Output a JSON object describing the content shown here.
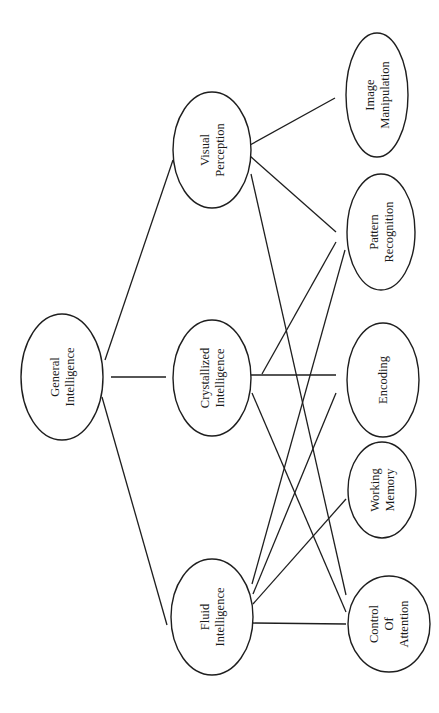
{
  "diagram": {
    "type": "hierarchy",
    "orientation": "rotated-90-clockwise",
    "colors": {
      "stroke": "#1e1e1e",
      "text": "#1a1a1a",
      "background": "#ffffff"
    },
    "nodes": [
      {
        "id": "general",
        "label": "General Intelligence",
        "lines": [
          "General",
          "Intelligence"
        ],
        "cx": 62,
        "cy": 377,
        "rx": 41,
        "ry": 63
      },
      {
        "id": "visual",
        "label": "Visual Perception",
        "lines": [
          "Visual",
          "Perception"
        ],
        "cx": 212,
        "cy": 150,
        "rx": 39,
        "ry": 58
      },
      {
        "id": "crystallized",
        "label": "Crystallized Intelligence",
        "lines": [
          "Crystallized",
          "Intelligence"
        ],
        "cx": 212,
        "cy": 378,
        "rx": 39,
        "ry": 58
      },
      {
        "id": "fluid",
        "label": "Fluid Intelligence",
        "lines": [
          "Fluid",
          "Intelligence"
        ],
        "cx": 212,
        "cy": 617,
        "rx": 41,
        "ry": 58
      },
      {
        "id": "image",
        "label": "Image Manipulation",
        "lines": [
          "Image",
          "Manipulation"
        ],
        "cx": 377,
        "cy": 95,
        "rx": 31,
        "ry": 62
      },
      {
        "id": "pattern",
        "label": "Pattern Recognition",
        "lines": [
          "Pattern",
          "Recognition"
        ],
        "cx": 381,
        "cy": 232,
        "rx": 34,
        "ry": 58
      },
      {
        "id": "encoding",
        "label": "Encoding",
        "lines": [
          "Encoding"
        ],
        "cx": 383,
        "cy": 380,
        "rx": 36,
        "ry": 57
      },
      {
        "id": "working",
        "label": "Working Memory",
        "lines": [
          "Working",
          "Memory"
        ],
        "cx": 382,
        "cy": 490,
        "rx": 34,
        "ry": 48
      },
      {
        "id": "control",
        "label": "Control Of Attention",
        "lines": [
          "Control",
          "Of",
          "Attention"
        ],
        "cx": 389,
        "cy": 624,
        "rx": 41,
        "ry": 48
      }
    ],
    "edges": [
      {
        "from": "general",
        "to": "visual",
        "x1": 105,
        "y1": 360,
        "x2": 173,
        "y2": 160
      },
      {
        "from": "general",
        "to": "crystallized",
        "x1": 111,
        "y1": 377,
        "x2": 166,
        "y2": 377
      },
      {
        "from": "general",
        "to": "fluid",
        "x1": 102,
        "y1": 397,
        "x2": 167,
        "y2": 625
      },
      {
        "from": "visual",
        "to": "image",
        "x1": 250,
        "y1": 145,
        "x2": 335,
        "y2": 98
      },
      {
        "from": "visual",
        "to": "pattern",
        "x1": 250,
        "y1": 156,
        "x2": 336,
        "y2": 232
      },
      {
        "from": "visual",
        "to": "control",
        "x1": 251,
        "y1": 174,
        "x2": 346,
        "y2": 595
      },
      {
        "from": "crystallized",
        "to": "pattern",
        "x1": 262,
        "y1": 374,
        "x2": 336,
        "y2": 242
      },
      {
        "from": "crystallized",
        "to": "encoding",
        "x1": 251,
        "y1": 375,
        "x2": 336,
        "y2": 375
      },
      {
        "from": "crystallized",
        "to": "control",
        "x1": 252,
        "y1": 393,
        "x2": 346,
        "y2": 612
      },
      {
        "from": "fluid",
        "to": "pattern",
        "x1": 252,
        "y1": 584,
        "x2": 345,
        "y2": 250
      },
      {
        "from": "fluid",
        "to": "encoding",
        "x1": 253,
        "y1": 594,
        "x2": 336,
        "y2": 393
      },
      {
        "from": "fluid",
        "to": "working",
        "x1": 253,
        "y1": 604,
        "x2": 346,
        "y2": 499
      },
      {
        "from": "fluid",
        "to": "control",
        "x1": 253,
        "y1": 623,
        "x2": 346,
        "y2": 624
      }
    ]
  }
}
